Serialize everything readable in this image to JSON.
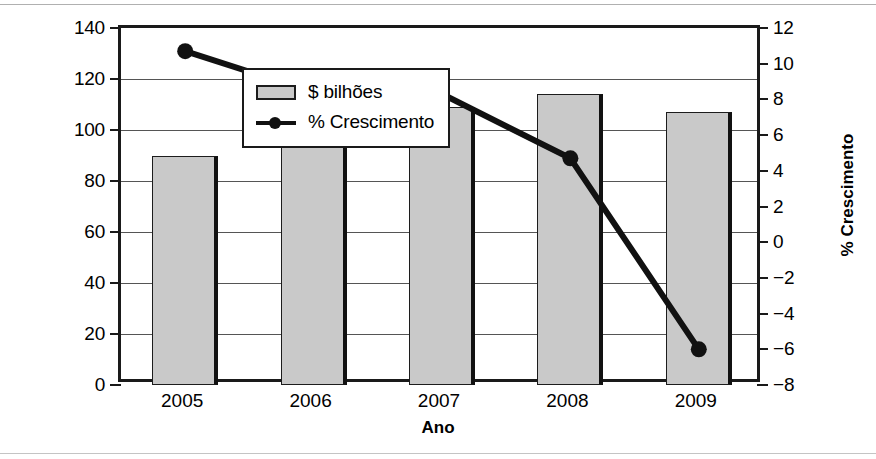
{
  "figure": {
    "name": "dual-axis-bar-line-chart",
    "background": "#ffffff",
    "frame_color": "#1a1a1a"
  },
  "chart_data": {
    "type": "bar",
    "title": "",
    "subtitle": "",
    "xlabel": "Ano",
    "categories": [
      "2005",
      "2006",
      "2007",
      "2008",
      "2009"
    ],
    "series": [
      {
        "name": "$ bilhões",
        "type": "bar",
        "axis": "left",
        "color": "#c9c9c9",
        "edge_color": "#1c1c1c",
        "values": [
          90,
          100,
          109,
          114,
          107
        ]
      },
      {
        "name": "% Crescimento",
        "type": "line",
        "axis": "right",
        "color": "#111111",
        "marker": "circle",
        "values": [
          10.7,
          8.4,
          8.3,
          4.7,
          -6.0
        ]
      }
    ],
    "left_axis": {
      "label": "$ bilhões",
      "ylim": [
        0,
        140
      ],
      "ticks": [
        0,
        20,
        40,
        60,
        80,
        100,
        120,
        140
      ],
      "tick_labels": [
        "0",
        "20",
        "40",
        "60",
        "80",
        "100",
        "120",
        "140"
      ]
    },
    "right_axis": {
      "label": "% Crescimento",
      "ylim": [
        -8,
        12
      ],
      "ticks": [
        -8,
        -6,
        -4,
        -2,
        0,
        2,
        4,
        6,
        8,
        10,
        12
      ],
      "tick_labels": [
        "−8",
        "−6",
        "−4",
        "−2",
        "0",
        "2",
        "4",
        "6",
        "8",
        "10",
        "12"
      ]
    },
    "grid": {
      "horizontal": true,
      "vertical": false,
      "gridline_values_left": [
        20,
        40,
        60,
        80,
        100,
        120
      ]
    },
    "legend": {
      "position": "top-left-inside",
      "entries": [
        {
          "label": "$ bilhões",
          "swatch": "bar-swatch"
        },
        {
          "label": "% Crescimento",
          "swatch": "line-marker-swatch"
        }
      ]
    }
  }
}
